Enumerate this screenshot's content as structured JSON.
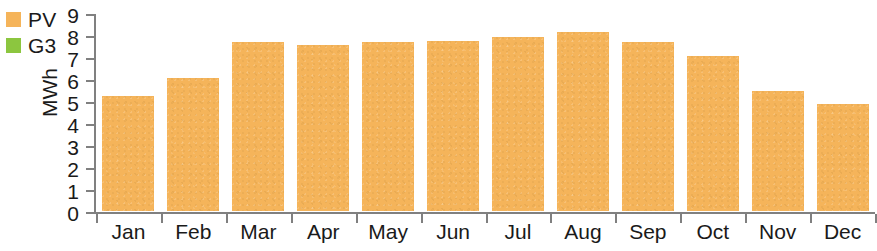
{
  "chart_data": {
    "type": "bar",
    "title": "",
    "subtitle": "",
    "xlabel": "",
    "ylabel": "MWh",
    "categories": [
      "Jan",
      "Feb",
      "Mar",
      "Apr",
      "May",
      "Jun",
      "Jul",
      "Aug",
      "Sep",
      "Oct",
      "Nov",
      "Dec"
    ],
    "series": [
      {
        "name": "PV",
        "color": "#f5b45a",
        "values": [
          5.25,
          6.05,
          7.7,
          7.55,
          7.7,
          7.75,
          7.9,
          8.15,
          7.7,
          7.05,
          5.45,
          4.85
        ]
      },
      {
        "name": "G3",
        "color": "#8cc63f",
        "values": [
          0,
          0,
          0,
          0,
          0,
          0,
          0,
          0,
          0,
          0,
          0,
          0
        ]
      }
    ],
    "ylim": [
      0,
      9
    ],
    "yticks": [
      0,
      1,
      2,
      3,
      4,
      5,
      6,
      7,
      8,
      9
    ],
    "ytick_labels": [
      "0",
      "1",
      "2",
      "3",
      "4",
      "5",
      "6",
      "7",
      "8",
      "9"
    ],
    "grid": false,
    "legend_position": "top-left",
    "axis_color": "#808080"
  },
  "legend": {
    "items": [
      {
        "label": "PV",
        "color": "#f5b45a"
      },
      {
        "label": "G3",
        "color": "#8cc63f"
      }
    ]
  }
}
